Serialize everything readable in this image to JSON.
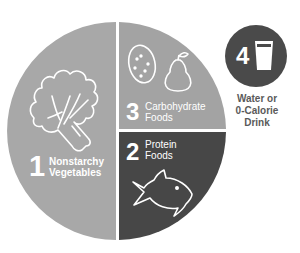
{
  "colors": {
    "light_section": "#a8a8a8",
    "carb_section": "#a3a3a3",
    "protein_section": "#474747",
    "drink_circle": "#4a4a4a",
    "divider": "#ffffff",
    "caption_text": "#5a5a5a"
  },
  "sections": [
    {
      "number": "1",
      "label_line1": "Nonstarchy",
      "label_line2": "Vegetables",
      "icon": "lettuce-icon",
      "portion": "half plate"
    },
    {
      "number": "2",
      "label_line1": "Protein",
      "label_line2": "Foods",
      "icon": "fish-icon",
      "portion": "quarter plate"
    },
    {
      "number": "3",
      "label_line1": "Carbohydrate",
      "label_line2": "Foods",
      "icon": "potato-and-pear-icon",
      "portion": "quarter plate"
    }
  ],
  "drink": {
    "number": "4",
    "icon": "glass-icon",
    "caption_line1": "Water or",
    "caption_line2": "0-Calorie",
    "caption_line3": "Drink"
  }
}
